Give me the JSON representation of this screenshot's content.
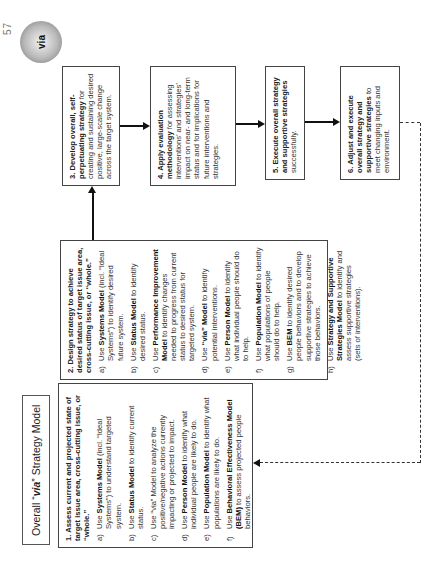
{
  "page": {
    "number": "57"
  },
  "title": {
    "prefix": "Overall “",
    "brand": "via",
    "suffix": "” Strategy Model"
  },
  "logo": {
    "text": "via"
  },
  "boxes": {
    "b1": {
      "head": "1. Assess current and projected state of target issue area, cross-cutting issue, or “whole.”",
      "items": [
        {
          "ltr": "a)",
          "pre": "Use ",
          "bold": "Systems Model",
          "post": " (incl. “Ideal Systems”) to understand targeted system."
        },
        {
          "ltr": "b)",
          "pre": "Use ",
          "bold": "Status Model",
          "post": " to identify current status."
        },
        {
          "ltr": "c)",
          "pre": "Use “via” Model to analyze the positive/negative actions currently impacting or projected to impact.",
          "bold": "",
          "post": ""
        },
        {
          "ltr": "d)",
          "pre": "Use ",
          "bold": "Person Model",
          "post": " to identify what individual people are likely to do."
        },
        {
          "ltr": "e)",
          "pre": "Use ",
          "bold": "Population Model",
          "post": " to identify what populations are likely to do."
        },
        {
          "ltr": "f)",
          "pre": "Use ",
          "bold": "Behavioral Effectiveness Model (BEM)",
          "post": " to assess projected people behaviors."
        }
      ]
    },
    "b2": {
      "head": "2. Design strategy to achieve desired status of target issue area, cross-cutting issue, or “whole.”",
      "items": [
        {
          "ltr": "a)",
          "pre": "Use ",
          "bold": "Systems Model",
          "post": " (incl. “Ideal Systems”) to identify desired future system."
        },
        {
          "ltr": "b)",
          "pre": "Use ",
          "bold": "Status Model",
          "post": " to identify desired status."
        },
        {
          "ltr": "c)",
          "pre": "Use ",
          "bold": "Performance Improvement Model",
          "post": " to identify changes needed to progress from current status to desired status for targeted system."
        },
        {
          "ltr": "d)",
          "pre": "Use ",
          "bold": "“via” Model",
          "post": " to identify potential interventions."
        },
        {
          "ltr": "e)",
          "pre": "Use ",
          "bold": "Person Model",
          "post": " to identify what individual people should do to help."
        },
        {
          "ltr": "f)",
          "pre": "Use ",
          "bold": "Population Model",
          "post": " to identify what populations of people should do to help."
        },
        {
          "ltr": "g)",
          "pre": "Use ",
          "bold": "BEM",
          "post": " to identify desired people behaviors and to develop supportive strategies to achieve those behaviors."
        },
        {
          "ltr": "h)",
          "pre": "Use ",
          "bold": "Strategy and Supportive Strategies Model",
          "post": " to identify and assess supportive strategies (sets of interventions)."
        }
      ]
    },
    "b3": {
      "bold": "3. Develop overall, self-perpetuating strategy",
      "rest": " for creating and sustaining desired positive, large-scale change across the target system."
    },
    "b4": {
      "bold": "4. Apply evaluation methodology",
      "rest": " for assessing interventions’ and strategies’ impact on near- and long-term status and for implications for future interventions and strategies."
    },
    "b5": {
      "bold": "5. Execute overall strategy and supportive strategies",
      "rest": " successfully."
    },
    "b6": {
      "bold": "6. Adjust and execute overall strategy and supportive strategies",
      "rest": " to meet changing inputs and environment."
    }
  }
}
